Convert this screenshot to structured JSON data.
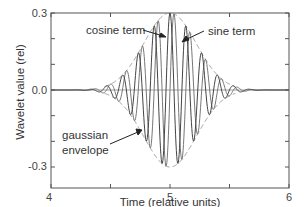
{
  "chart_data": {
    "type": "line",
    "title": "",
    "xlabel": "Time (relative units)",
    "ylabel": "Wavelet value (rel)",
    "xlim": [
      4,
      6
    ],
    "ylim": [
      -0.38,
      0.3
    ],
    "xticks": [
      4,
      5,
      6
    ],
    "xtick_labels": [
      "4",
      "5",
      "6"
    ],
    "x_minor_ticks": [
      4.5,
      5.5
    ],
    "yticks": [
      -0.3,
      0.0,
      0.3
    ],
    "ytick_labels": [
      "-0.3",
      "0.0",
      "0.3"
    ],
    "y_minor_ticks": [
      -0.2,
      -0.1,
      0.1,
      0.2
    ],
    "grid": false,
    "legend": "none (inline annotations)",
    "wavelet_params": {
      "center": 5.0,
      "amplitude": 0.3,
      "sigma": 0.22,
      "frequency": 7.5
    },
    "series": [
      {
        "name": "cosine term",
        "style": "solid",
        "color": "#555555",
        "formula": "A*exp(-(t-c)^2/(2*s^2))*cos(2*pi*f*(t-c))"
      },
      {
        "name": "sine term",
        "style": "solid",
        "color": "#777777",
        "formula": "A*exp(-(t-c)^2/(2*s^2))*sin(2*pi*f*(t-c))"
      },
      {
        "name": "gaussian envelope",
        "style": "dashed",
        "color": "#999999",
        "formula": "±A*exp(-(t-c)^2/(2*s^2))"
      }
    ],
    "annotations": [
      {
        "text": "cosine term",
        "points_to": "cosine peak near t=4.98"
      },
      {
        "text": "sine term",
        "points_to": "sine peak near t=5.04"
      },
      {
        "text": "gaussian\nenvelope",
        "points_to": "lower envelope near t=4.78"
      }
    ]
  },
  "labels": {
    "xlabel": "Time (relative units)",
    "ylabel": "Wavelet value (rel)",
    "x4": "4",
    "x5": "5",
    "x6": "6",
    "y_top": "0.3",
    "y_mid": "0.0",
    "y_bot": "-0.3",
    "cosine": "cosine term",
    "sine": "sine term",
    "gauss1": "gaussian",
    "gauss2": "envelope"
  }
}
